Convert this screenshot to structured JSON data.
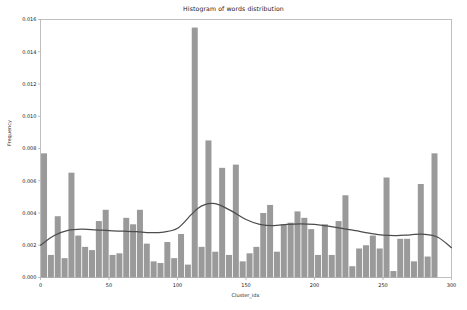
{
  "chart_data": {
    "type": "bar",
    "title": "Histogram of words distribution",
    "xlabel": "Cluster_idx",
    "ylabel": "Frequency",
    "xlim": [
      0,
      300
    ],
    "ylim": [
      0.0,
      0.016
    ],
    "xticks": [
      0,
      50,
      100,
      150,
      200,
      250,
      300
    ],
    "xticklabels": [
      "0",
      "50",
      "100",
      "150",
      "200",
      "250",
      "300"
    ],
    "yticks": [
      0.0,
      0.002,
      0.004,
      0.006,
      0.008,
      0.01,
      0.012,
      0.014,
      0.016
    ],
    "yticklabels": [
      "0.000",
      "0.002",
      "0.004",
      "0.006",
      "0.008",
      "0.010",
      "0.012",
      "0.014",
      "0.016"
    ],
    "grid": false,
    "legend": "none",
    "bin_width": 5,
    "bar_color": "#9a9a9a",
    "kde_color": "#4d4d4d",
    "axes_color": "#b0b0b0",
    "bin_left_edges": [
      0,
      5,
      10,
      15,
      20,
      25,
      30,
      35,
      40,
      45,
      50,
      55,
      60,
      65,
      70,
      75,
      80,
      85,
      90,
      95,
      100,
      105,
      110,
      115,
      120,
      125,
      130,
      135,
      140,
      145,
      150,
      155,
      160,
      165,
      170,
      175,
      180,
      185,
      190,
      195,
      200,
      205,
      210,
      215,
      220,
      225,
      230,
      235,
      240,
      245,
      250,
      255,
      260,
      265,
      270,
      275,
      280,
      285,
      290,
      295
    ],
    "values": [
      0.0077,
      0.0014,
      0.0038,
      0.0012,
      0.0065,
      0.0026,
      0.0019,
      0.0017,
      0.0035,
      0.0042,
      0.0014,
      0.0015,
      0.0037,
      0.0033,
      0.0042,
      0.0021,
      0.001,
      0.0009,
      0.0022,
      0.0012,
      0.0027,
      0.0008,
      0.0155,
      0.0019,
      0.0085,
      0.0016,
      0.0068,
      0.0014,
      0.007,
      0.001,
      0.0015,
      0.0019,
      0.004,
      0.0045,
      0.0016,
      0.0033,
      0.0034,
      0.0041,
      0.0037,
      0.003,
      0.0014,
      0.0033,
      0.0014,
      0.0035,
      0.0051,
      0.0007,
      0.0018,
      0.002,
      0.0026,
      0.0018,
      0.0062,
      0.0004,
      0.0024,
      0.0024,
      0.001,
      0.0058,
      0.0013,
      0.0077
    ],
    "kde_curve": {
      "description": "Kernel density estimate overlay",
      "x": [
        0,
        10,
        20,
        30,
        40,
        50,
        60,
        70,
        80,
        90,
        100,
        110,
        115,
        120,
        125,
        130,
        140,
        150,
        160,
        170,
        180,
        190,
        200,
        210,
        220,
        230,
        240,
        250,
        260,
        270,
        280,
        290,
        300
      ],
      "y": [
        0.002,
        0.0026,
        0.00292,
        0.003,
        0.00296,
        0.0029,
        0.00287,
        0.00284,
        0.00278,
        0.00282,
        0.00305,
        0.0039,
        0.0043,
        0.00452,
        0.0046,
        0.00452,
        0.0041,
        0.0036,
        0.0033,
        0.00322,
        0.0033,
        0.00333,
        0.0033,
        0.00318,
        0.00305,
        0.0029,
        0.00275,
        0.00263,
        0.0026,
        0.00265,
        0.00268,
        0.0025,
        0.00185
      ]
    }
  }
}
